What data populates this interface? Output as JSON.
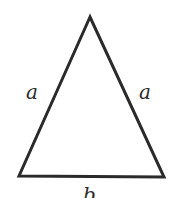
{
  "diagram": {
    "type": "isosceles-triangle",
    "stroke_color": "#2a2a2a",
    "background": "#ffffff",
    "vertices": {
      "apex": [
        90,
        17
      ],
      "bottom_left": [
        19,
        176
      ],
      "bottom_right": [
        164,
        177
      ]
    },
    "labels": {
      "left_side": "a",
      "right_side": "a",
      "base": "b"
    }
  }
}
